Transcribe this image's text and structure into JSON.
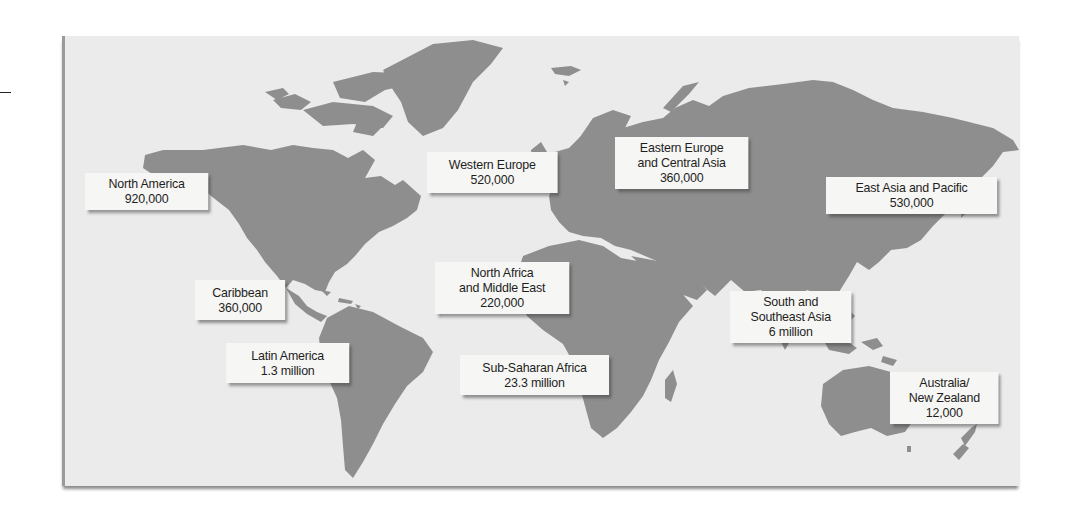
{
  "map": {
    "title": "World map of regional figures",
    "land_color": "#8e8e8e",
    "water_color": "#ebebeb",
    "label_bg": "#f6f6f4"
  },
  "regions": [
    {
      "id": "north-america",
      "lines": [
        "North America"
      ],
      "value": "920,000"
    },
    {
      "id": "western-europe",
      "lines": [
        "Western Europe"
      ],
      "value": "520,000"
    },
    {
      "id": "eastern-europe-central-asia",
      "lines": [
        "Eastern Europe",
        "and Central Asia"
      ],
      "value": "360,000"
    },
    {
      "id": "east-asia-pacific",
      "lines": [
        "East Asia and Pacific"
      ],
      "value": "530,000"
    },
    {
      "id": "caribbean",
      "lines": [
        "Caribbean"
      ],
      "value": "360,000"
    },
    {
      "id": "north-africa-middle-east",
      "lines": [
        "North Africa",
        "and Middle East"
      ],
      "value": "220,000"
    },
    {
      "id": "latin-america",
      "lines": [
        "Latin America"
      ],
      "value": "1.3 million"
    },
    {
      "id": "sub-saharan-africa",
      "lines": [
        "Sub-Saharan Africa"
      ],
      "value": "23.3 million"
    },
    {
      "id": "south-southeast-asia",
      "lines": [
        "South and",
        "Southeast Asia"
      ],
      "value": "6 million"
    },
    {
      "id": "australia-new-zealand",
      "lines": [
        "Australia/",
        "New Zealand"
      ],
      "value": "12,000"
    }
  ]
}
